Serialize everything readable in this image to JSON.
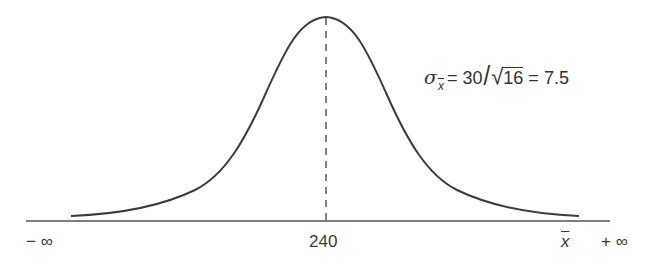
{
  "diagram": {
    "type": "normal-distribution-curve",
    "mean": 240,
    "mean_label": "240",
    "left_label": "− ∞",
    "right_label": "+ ∞",
    "axis_variable": "x",
    "formula": {
      "symbol": "σ",
      "subscript": "x",
      "equals1": "=",
      "numerator": "30",
      "slash": "/",
      "radical": "√",
      "radicand": "16",
      "equals2": "=",
      "result": "7.5",
      "full_text": "σx̄ = 30/√16 = 7.5"
    },
    "colors": {
      "curve": "#3c3c3c",
      "axis": "#4a4a4a",
      "dashed_line": "#555555",
      "text": "#333333"
    }
  }
}
